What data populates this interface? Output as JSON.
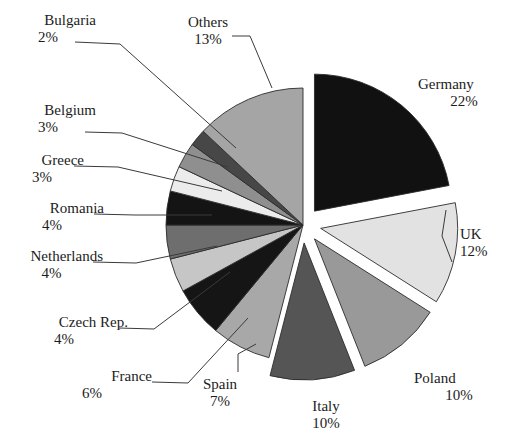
{
  "chart_data": {
    "type": "pie",
    "title": "",
    "subtitle": "",
    "xlabel": "",
    "ylabel": "",
    "legend_position": "none",
    "grid": false,
    "units": "percent",
    "categories": [
      "Germany",
      "UK",
      "Poland",
      "Italy",
      "Spain",
      "France",
      "Czech Rep.",
      "Netherlands",
      "Romania",
      "Greece",
      "Belgium",
      "Bulgaria",
      "Others"
    ],
    "values": [
      22,
      12,
      10,
      10,
      7,
      6,
      4,
      4,
      4,
      3,
      3,
      2,
      13
    ],
    "slices": [
      {
        "label": "Germany",
        "value": 22,
        "pct_text": "22%",
        "color": "#111111",
        "exploded": true,
        "start_deg": 0.0,
        "end_deg": 79.2
      },
      {
        "label": "UK",
        "value": 12,
        "pct_text": "12%",
        "color": "#e2e2e2",
        "exploded": true,
        "start_deg": 79.2,
        "end_deg": 122.4
      },
      {
        "label": "Poland",
        "value": 10,
        "pct_text": "10%",
        "color": "#999999",
        "exploded": true,
        "start_deg": 122.4,
        "end_deg": 158.4
      },
      {
        "label": "Italy",
        "value": 10,
        "pct_text": "10%",
        "color": "#555555",
        "exploded": true,
        "start_deg": 158.4,
        "end_deg": 194.4
      },
      {
        "label": "Spain",
        "value": 7,
        "pct_text": "7%",
        "color": "#a8a8a8",
        "exploded": false,
        "start_deg": 194.4,
        "end_deg": 219.6
      },
      {
        "label": "France",
        "value": 6,
        "pct_text": "6%",
        "color": "#151515",
        "exploded": false,
        "start_deg": 219.6,
        "end_deg": 241.2
      },
      {
        "label": "Czech Rep.",
        "value": 4,
        "pct_text": "4%",
        "color": "#c6c6c6",
        "exploded": false,
        "start_deg": 241.2,
        "end_deg": 255.6
      },
      {
        "label": "Netherlands",
        "value": 4,
        "pct_text": "4%",
        "color": "#6e6e6e",
        "exploded": false,
        "start_deg": 255.6,
        "end_deg": 270.0
      },
      {
        "label": "Romania",
        "value": 4,
        "pct_text": "4%",
        "color": "#141414",
        "exploded": false,
        "start_deg": 270.0,
        "end_deg": 284.4
      },
      {
        "label": "Greece",
        "value": 3,
        "pct_text": "3%",
        "color": "#ececec",
        "exploded": false,
        "start_deg": 284.4,
        "end_deg": 295.2
      },
      {
        "label": "Belgium",
        "value": 3,
        "pct_text": "3%",
        "color": "#8f8f8f",
        "exploded": false,
        "start_deg": 295.2,
        "end_deg": 306.0
      },
      {
        "label": "Bulgaria",
        "value": 2,
        "pct_text": "2%",
        "color": "#474747",
        "exploded": false,
        "start_deg": 306.0,
        "end_deg": 313.2
      },
      {
        "label": "Others",
        "value": 13,
        "pct_text": "13%",
        "color": "#a5a5a5",
        "exploded": false,
        "start_deg": 313.2,
        "end_deg": 360.0
      }
    ]
  },
  "labels": {
    "bulgaria": {
      "name": "Bulgaria",
      "pct": "2%"
    },
    "belgium": {
      "name": "Belgium",
      "pct": "3%"
    },
    "greece": {
      "name": "Greece",
      "pct": "3%"
    },
    "romania": {
      "name": "Romania",
      "pct": "4%"
    },
    "netherlands": {
      "name": "Netherlands",
      "pct": "4%"
    },
    "czech": {
      "name": "Czech Rep.",
      "pct": "4%"
    },
    "france": {
      "name": "France",
      "pct": "6%"
    },
    "spain": {
      "name": "Spain",
      "pct": "7%"
    },
    "italy": {
      "name": "Italy",
      "pct": "10%"
    },
    "poland": {
      "name": "Poland",
      "pct": "10%"
    },
    "uk": {
      "name": "UK",
      "pct": "12%"
    },
    "germany": {
      "name": "Germany",
      "pct": "22%"
    },
    "others": {
      "name": "Others",
      "pct": "13%"
    }
  },
  "colors": {
    "background": "#ffffff",
    "text": "#1c1c1c",
    "leader_line": "#3a3a3a",
    "slice_outline": "#2b2b2b"
  }
}
